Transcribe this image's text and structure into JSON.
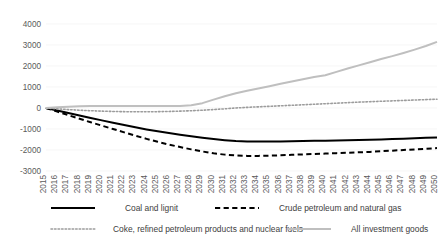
{
  "chart_data": {
    "type": "line",
    "title": "",
    "subtitle": "",
    "xlabel": "",
    "ylabel": "",
    "ylim": [
      -3000,
      4000
    ],
    "ytick_labels": [
      "4000",
      "3000",
      "2000",
      "1000",
      "0",
      "-1000",
      "-2000",
      "-3000"
    ],
    "ytick_values": [
      4000,
      3000,
      2000,
      1000,
      0,
      -1000,
      -2000,
      -3000
    ],
    "grid": true,
    "legend_position": "bottom",
    "categories": [
      "2015",
      "2016",
      "2017",
      "2018",
      "2019",
      "2020",
      "2021",
      "2022",
      "2023",
      "2024",
      "2025",
      "2026",
      "2027",
      "2028",
      "2029",
      "2030",
      "2031",
      "2032",
      "2033",
      "2034",
      "2035",
      "2036",
      "2037",
      "2038",
      "2039",
      "2040",
      "2041",
      "2042",
      "2043",
      "2044",
      "2045",
      "2046",
      "2047",
      "2048",
      "2049",
      "2050"
    ],
    "series": [
      {
        "name": "Coal and lignit",
        "style": "solid",
        "color": "#000000",
        "width": 2.0,
        "values": [
          0,
          -120,
          -240,
          -360,
          -480,
          -590,
          -700,
          -810,
          -920,
          -1020,
          -1110,
          -1190,
          -1270,
          -1350,
          -1420,
          -1480,
          -1530,
          -1570,
          -1590,
          -1600,
          -1600,
          -1595,
          -1585,
          -1575,
          -1565,
          -1555,
          -1545,
          -1535,
          -1525,
          -1515,
          -1500,
          -1480,
          -1460,
          -1440,
          -1420,
          -1400
        ]
      },
      {
        "name": "Crude petroleum and natural gas",
        "style": "dashed",
        "color": "#000000",
        "width": 2.0,
        "values": [
          0,
          -170,
          -340,
          -510,
          -680,
          -840,
          -1000,
          -1160,
          -1320,
          -1470,
          -1610,
          -1740,
          -1860,
          -1970,
          -2070,
          -2160,
          -2220,
          -2260,
          -2280,
          -2280,
          -2270,
          -2250,
          -2230,
          -2210,
          -2190,
          -2170,
          -2150,
          -2130,
          -2110,
          -2090,
          -2060,
          -2030,
          -2000,
          -1970,
          -1940,
          -1910
        ]
      },
      {
        "name": "Coke, refined petroleum products and nuclear fuels",
        "style": "dotted",
        "color": "#9c9c9c",
        "width": 1.6,
        "values": [
          0,
          -40,
          -75,
          -105,
          -130,
          -150,
          -165,
          -175,
          -180,
          -180,
          -175,
          -165,
          -150,
          -130,
          -105,
          -75,
          -40,
          0,
          30,
          55,
          80,
          105,
          130,
          155,
          180,
          205,
          230,
          255,
          280,
          300,
          320,
          340,
          360,
          380,
          400,
          420
        ]
      },
      {
        "name": "All investment goods",
        "style": "solid",
        "color": "#bfbfbf",
        "width": 2.0,
        "values": [
          0,
          40,
          65,
          80,
          90,
          95,
          98,
          100,
          100,
          98,
          95,
          92,
          90,
          130,
          230,
          400,
          560,
          700,
          820,
          930,
          1040,
          1150,
          1260,
          1370,
          1480,
          1560,
          1720,
          1880,
          2030,
          2180,
          2330,
          2470,
          2620,
          2780,
          2950,
          3150
        ]
      }
    ]
  },
  "legend": {
    "items": [
      {
        "label": "Coal and lignit",
        "marker": "solid-line-marker"
      },
      {
        "label": "Crude petroleum and natural gas",
        "marker": "dashed-line-marker"
      },
      {
        "label": "Coke, refined petroleum products and nuclear fuels",
        "marker": "dotted-line-marker"
      },
      {
        "label": "All investment goods",
        "marker": "solid-line-marker"
      }
    ]
  }
}
